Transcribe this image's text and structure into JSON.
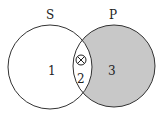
{
  "diagram": {
    "type": "venn",
    "sets": [
      {
        "name": "S",
        "label": "S"
      },
      {
        "name": "P",
        "label": "P"
      }
    ],
    "regions": [
      {
        "id": "1",
        "label": "1",
        "shaded": false
      },
      {
        "id": "2",
        "label": "2",
        "shaded": false,
        "marker": "⊗"
      },
      {
        "id": "3",
        "label": "3",
        "shaded": true
      }
    ],
    "colors": {
      "shade": "#c8c8c8",
      "stroke": "#333333",
      "background": "#ffffff"
    }
  }
}
